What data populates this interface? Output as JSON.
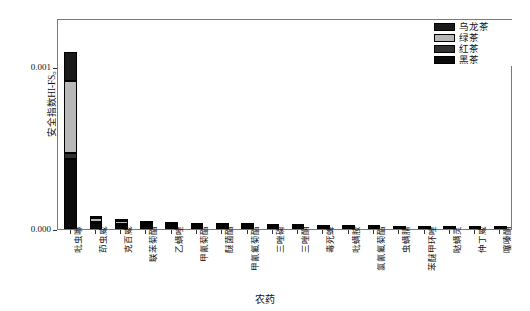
{
  "chart_data": {
    "type": "bar",
    "stacked": true,
    "title": "",
    "xlabel": "农药",
    "ylabel": "安全指数HI-FS。",
    "ylim": [
      0.0,
      0.0013
    ],
    "yticks": [
      0.0,
      0.001
    ],
    "ytick_labels": [
      "0.000",
      "0.001"
    ],
    "grid": false,
    "legend_position": "top-right",
    "categories": [
      "吡虫啉",
      "茚虫威",
      "克百威",
      "联苯菊酯",
      "乙螨唑",
      "甲氰菊酯",
      "醚菌酯",
      "甲氰氟菊酯",
      "三唑磷",
      "三唑酮",
      "毒死蜱",
      "吡螨胺",
      "氯氰氟菊酯",
      "虫螨腈",
      "苯醚甲环唑",
      "哒螨灵",
      "仲丁威",
      "噻嗪酮"
    ],
    "series": [
      {
        "name": "乌龙茶",
        "color": "#1a1a1a",
        "values": [
          0.00018,
          1.2e-05,
          1e-05,
          7e-06,
          6e-06,
          6e-06,
          5e-06,
          5e-06,
          4e-06,
          4e-06,
          3e-06,
          3e-06,
          3e-06,
          2e-06,
          2e-06,
          1e-06,
          1e-06,
          1e-06
        ]
      },
      {
        "name": "绿茶",
        "color": "#b8b8b8",
        "values": [
          0.00044,
          2.2e-05,
          1.6e-05,
          1.3e-05,
          1e-05,
          9e-06,
          8e-06,
          8e-06,
          6e-06,
          6e-06,
          5e-06,
          4e-06,
          4e-06,
          3e-06,
          3e-06,
          2e-06,
          2e-06,
          2e-06
        ]
      },
      {
        "name": "红茶",
        "color": "#303030",
        "values": [
          4e-05,
          9e-06,
          7e-06,
          5e-06,
          4e-06,
          4e-06,
          3e-06,
          3e-06,
          3e-06,
          2e-06,
          2e-06,
          2e-06,
          2e-06,
          1e-06,
          1e-06,
          1e-06,
          1e-06,
          1e-06
        ]
      },
      {
        "name": "黑茶",
        "color": "#0a0a0a",
        "values": [
          0.00043,
          3.5e-05,
          2.5e-05,
          1.9e-05,
          1.5e-05,
          1.3e-05,
          1.2e-05,
          1.1e-05,
          9e-06,
          8e-06,
          7e-06,
          6e-06,
          6e-06,
          5e-06,
          4e-06,
          3e-06,
          3e-06,
          2e-06
        ]
      }
    ],
    "totals": [
      0.00109,
      7.8e-05,
      5.8e-05,
      4.4e-05,
      3.5e-05,
      3.2e-05,
      2.8e-05,
      2.7e-05,
      2.2e-05,
      2e-05,
      1.7e-05,
      1.5e-05,
      1.5e-05,
      1.1e-05,
      1e-05,
      7e-06,
      7e-06,
      6e-06
    ]
  },
  "legend": {
    "entries": [
      {
        "label": "乌龙茶",
        "color": "#1a1a1a"
      },
      {
        "label": "绿茶",
        "color": "#b8b8b8"
      },
      {
        "label": "红茶",
        "color": "#303030"
      },
      {
        "label": "黑茶",
        "color": "#0a0a0a"
      }
    ]
  },
  "axes": {
    "y_title": "安全指数HI-FS。",
    "x_title": "农药"
  }
}
